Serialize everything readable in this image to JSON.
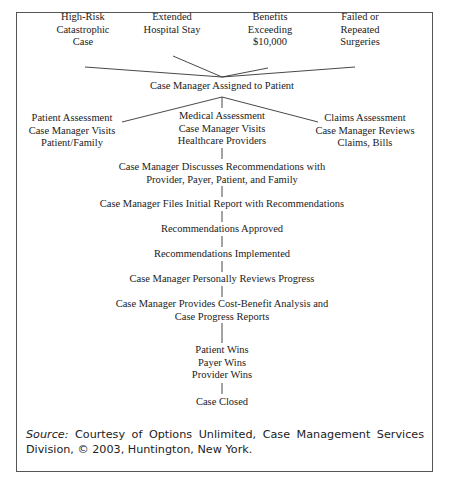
{
  "diagram": {
    "triggers": [
      {
        "lines": [
          "High-Risk",
          "Catastrophic",
          "Case"
        ]
      },
      {
        "lines": [
          "Extended",
          "Hospital Stay"
        ]
      },
      {
        "lines": [
          "Benefits",
          "Exceeding",
          "$10,000"
        ]
      },
      {
        "lines": [
          "Failed or",
          "Repeated",
          "Surgeries"
        ]
      }
    ],
    "assigned": "Case Manager Assigned to Patient",
    "assessments": [
      {
        "lines": [
          "Patient Assessment",
          "Case Manager Visits",
          "Patient/Family"
        ]
      },
      {
        "lines": [
          "Medical Assessment",
          "Case Manager Visits",
          "Healthcare Providers"
        ]
      },
      {
        "lines": [
          "Claims Assessment",
          "Case Manager Reviews",
          "Claims, Bills"
        ]
      }
    ],
    "steps": [
      {
        "lines": [
          "Case Manager Discusses Recommendations with",
          "Provider, Payer, Patient, and Family"
        ]
      },
      {
        "lines": [
          "Case Manager Files Initial Report with Recommendations"
        ]
      },
      {
        "lines": [
          "Recommendations Approved"
        ]
      },
      {
        "lines": [
          "Recommendations Implemented"
        ]
      },
      {
        "lines": [
          "Case Manager Personally Reviews Progress"
        ]
      },
      {
        "lines": [
          "Case Manager Provides Cost-Benefit Analysis and",
          "Case Progress Reports"
        ]
      },
      {
        "lines": [
          "Patient Wins",
          "Payer Wins",
          "Provider Wins"
        ]
      },
      {
        "lines": [
          "Case Closed"
        ]
      }
    ]
  },
  "source": {
    "label": "Source:",
    "text": " Courtesy of Options Unlimited, Case Management Services Division, © 2003, Huntington, New York."
  },
  "colors": {
    "text": "#222222",
    "lines": "#333333",
    "frame": "#555555"
  }
}
